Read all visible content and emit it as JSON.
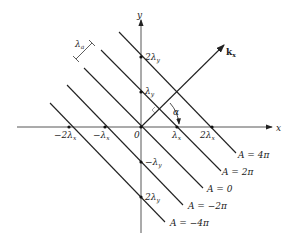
{
  "diagram": {
    "type": "plane-wave-phase-fronts",
    "axes": {
      "x_label": "x",
      "y_label": "y",
      "origin_label": "0"
    },
    "x_ticks": [
      {
        "label": "−2λ",
        "sub": "x",
        "n": -2
      },
      {
        "label": "−λ",
        "sub": "x",
        "n": -1
      },
      {
        "label": "λ",
        "sub": "x",
        "n": 1
      },
      {
        "label": "2λ",
        "sub": "x",
        "n": 2
      }
    ],
    "y_ticks": [
      {
        "label": "2λ",
        "sub": "y",
        "n": 2
      },
      {
        "label": "λ",
        "sub": "y",
        "n": 1
      },
      {
        "label": "−λ",
        "sub": "y",
        "n": -1
      },
      {
        "label": "2λ",
        "sub": "y",
        "n": -2
      }
    ],
    "wavevector": {
      "label": "k",
      "sub": "x"
    },
    "angle_label": "α",
    "wavelength_label": {
      "label": "λ",
      "sub": "a"
    },
    "phase_lines": [
      {
        "label": "A = 4π"
      },
      {
        "label": "A = 2π"
      },
      {
        "label": "A = 0"
      },
      {
        "label": "A =  −2π"
      },
      {
        "label": "A =  −4π"
      }
    ]
  }
}
